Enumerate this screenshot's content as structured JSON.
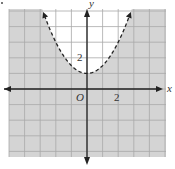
{
  "chart_data": {
    "type": "line",
    "title": "",
    "xlabel": "x",
    "ylabel": "y",
    "origin_label": "O",
    "xlim": [
      -5,
      5
    ],
    "ylim": [
      -4.3,
      5.1
    ],
    "x_tick_labels": [
      {
        "value": 2,
        "label": "2"
      }
    ],
    "y_tick_labels": [
      {
        "value": 2,
        "label": "2"
      }
    ],
    "grid": true,
    "grid_step": 1,
    "series": [
      {
        "name": "boundary",
        "style": "dashed",
        "equation": "y = 0.5x^2 + 1",
        "vertex": [
          0,
          1
        ],
        "x": [
          -2.8,
          -2,
          -1,
          0,
          1,
          2,
          2.8
        ],
        "y": [
          4.92,
          3,
          1.5,
          1,
          1.5,
          3,
          4.92
        ],
        "arrows": true
      }
    ],
    "shaded_region": "outside parabola (y < 0.5x^2 + 1)",
    "colors": {
      "shade": "#d4d4d4",
      "grid": "#a8a8a8",
      "axis": "#222222",
      "curve": "#222222"
    }
  },
  "labels": {
    "x_axis": "x",
    "y_axis": "y",
    "origin": "O",
    "x_tick": "2",
    "y_tick": "2"
  }
}
